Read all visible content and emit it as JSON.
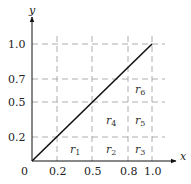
{
  "diagram": {
    "axes": {
      "x_label": "x",
      "y_label": "y",
      "origin_label": "0",
      "x_ticks": [
        "0.2",
        "0.5",
        "0.8",
        "1.0"
      ],
      "y_ticks": [
        "0.2",
        "0.5",
        "0.7",
        "1.0"
      ]
    },
    "line": {
      "from": [
        0,
        0
      ],
      "to": [
        1.0,
        1.0
      ],
      "color": "#111111"
    },
    "grid": {
      "style": "dashed",
      "color": "#999999"
    },
    "regions": [
      {
        "id": "r1",
        "base": "r",
        "sub": "1",
        "x": 0.3,
        "y": 0.1
      },
      {
        "id": "r2",
        "base": "r",
        "sub": "2",
        "x": 0.65,
        "y": 0.1
      },
      {
        "id": "r3",
        "base": "r",
        "sub": "3",
        "x": 0.9,
        "y": 0.1
      },
      {
        "id": "r4",
        "base": "r",
        "sub": "4",
        "x": 0.65,
        "y": 0.35
      },
      {
        "id": "r5",
        "base": "r",
        "sub": "5",
        "x": 0.9,
        "y": 0.35
      },
      {
        "id": "r6",
        "base": "r",
        "sub": "6",
        "x": 0.9,
        "y": 0.6
      }
    ]
  }
}
